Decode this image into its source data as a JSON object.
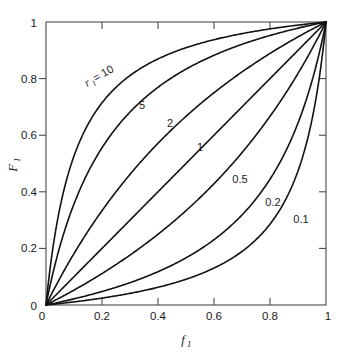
{
  "figure": {
    "background_color": "#ffffff",
    "curve_color": "#121212",
    "axis_color": "#4a4a4a",
    "text_color": "#1a1a1a"
  },
  "chart_data": {
    "type": "line",
    "title": "",
    "subtitle": "",
    "xlabel": "f",
    "xlabel_sub": "1",
    "ylabel": "F",
    "ylabel_sub": "1",
    "xlim": [
      0,
      1
    ],
    "ylim": [
      0,
      1
    ],
    "grid": false,
    "legend": "inline-curve-labels",
    "x_ticks": [
      0,
      0.2,
      0.4,
      0.6,
      0.8,
      1
    ],
    "x_tick_labels": [
      "0",
      "0.2",
      "0.4",
      "0.6",
      "0.8",
      "1"
    ],
    "y_ticks": [
      0,
      0.2,
      0.4,
      0.6,
      0.8,
      1
    ],
    "y_tick_labels": [
      "0",
      "0.2",
      "0.4",
      "0.6",
      "0.8",
      "1"
    ],
    "equation": "F1 = r1*f1 / (1 + (r1 - 1)*f1)",
    "series": [
      {
        "name": "r1 = 10",
        "r": 10,
        "label": "10",
        "label_prefix": "r",
        "label_prefix_sub": "1",
        "label_eq": " = 10",
        "x": [
          0,
          0.05,
          0.1,
          0.15,
          0.2,
          0.3,
          0.4,
          0.5,
          0.6,
          0.7,
          0.8,
          0.9,
          1
        ],
        "y": [
          0,
          0.345,
          0.526,
          0.638,
          0.714,
          0.811,
          0.87,
          0.909,
          0.938,
          0.959,
          0.976,
          0.989,
          1
        ]
      },
      {
        "name": "r1 = 5",
        "r": 5,
        "label": "5",
        "x": [
          0,
          0.05,
          0.1,
          0.15,
          0.2,
          0.3,
          0.4,
          0.5,
          0.6,
          0.7,
          0.8,
          0.9,
          1
        ],
        "y": [
          0,
          0.208,
          0.357,
          0.469,
          0.556,
          0.682,
          0.769,
          0.833,
          0.882,
          0.921,
          0.952,
          0.978,
          1
        ]
      },
      {
        "name": "r1 = 2",
        "r": 2,
        "label": "2",
        "x": [
          0,
          0.05,
          0.1,
          0.2,
          0.3,
          0.4,
          0.5,
          0.6,
          0.7,
          0.8,
          0.9,
          1
        ],
        "y": [
          0,
          0.095,
          0.182,
          0.333,
          0.462,
          0.571,
          0.667,
          0.75,
          0.824,
          0.889,
          0.947,
          1
        ]
      },
      {
        "name": "r1 = 1",
        "r": 1,
        "label": "1",
        "x": [
          0,
          0.2,
          0.4,
          0.6,
          0.8,
          1
        ],
        "y": [
          0,
          0.2,
          0.4,
          0.6,
          0.8,
          1
        ]
      },
      {
        "name": "r1 = 0.5",
        "r": 0.5,
        "label": "0.5",
        "x": [
          0,
          0.1,
          0.2,
          0.3,
          0.4,
          0.5,
          0.6,
          0.7,
          0.8,
          0.9,
          0.95,
          1
        ],
        "y": [
          0,
          0.053,
          0.111,
          0.176,
          0.25,
          0.333,
          0.429,
          0.538,
          0.667,
          0.818,
          0.905,
          1
        ]
      },
      {
        "name": "r1 = 0.2",
        "r": 0.2,
        "label": "0.2",
        "x": [
          0,
          0.1,
          0.2,
          0.3,
          0.4,
          0.5,
          0.6,
          0.7,
          0.8,
          0.9,
          0.95,
          1
        ],
        "y": [
          0,
          0.022,
          0.048,
          0.079,
          0.118,
          0.167,
          0.231,
          0.318,
          0.444,
          0.643,
          0.792,
          1
        ]
      },
      {
        "name": "r1 = 0.1",
        "r": 0.1,
        "label": "0.1",
        "x": [
          0,
          0.1,
          0.2,
          0.3,
          0.4,
          0.5,
          0.6,
          0.7,
          0.8,
          0.9,
          0.95,
          1
        ],
        "y": [
          0,
          0.011,
          0.024,
          0.041,
          0.062,
          0.091,
          0.13,
          0.189,
          0.286,
          0.474,
          0.655,
          1
        ]
      }
    ],
    "annotations": [
      {
        "text": "r1 = 10",
        "x": 0.145,
        "y": 0.8
      },
      {
        "text": "5",
        "x": 0.29,
        "y": 0.715
      },
      {
        "text": "2",
        "x": 0.385,
        "y": 0.655
      },
      {
        "text": "1",
        "x": 0.5,
        "y": 0.565
      },
      {
        "text": "0.5",
        "x": 0.655,
        "y": 0.455
      },
      {
        "text": "0.2",
        "x": 0.775,
        "y": 0.375
      },
      {
        "text": "0.1",
        "x": 0.875,
        "y": 0.315
      }
    ]
  }
}
